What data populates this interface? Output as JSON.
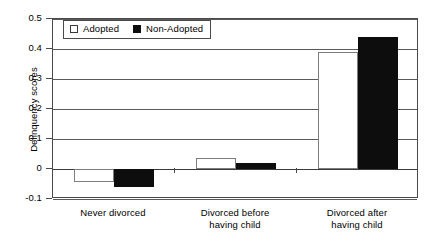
{
  "chart_data": {
    "type": "bar",
    "title": "",
    "xlabel": "",
    "ylabel": "Delinquency scores",
    "ylim": [
      -0.1,
      0.5
    ],
    "ytick_labels": [
      "0.5",
      "0.4",
      "0.3",
      "0.2",
      "0.1",
      "0",
      "-0.1"
    ],
    "ytick_values": [
      0.5,
      0.4,
      0.3,
      0.2,
      0.1,
      0,
      -0.1
    ],
    "grid": true,
    "legend_position": "top-left",
    "categories": [
      "Never divorced",
      "Divorced before having child",
      "Divorced after having child"
    ],
    "category_lines": [
      [
        "Never divorced"
      ],
      [
        "Divorced before",
        "having child"
      ],
      [
        "Divorced after",
        "having child"
      ]
    ],
    "series": [
      {
        "name": "Adopted",
        "color": "#ffffff",
        "edge_color": "#7d7d7d",
        "values": [
          -0.043,
          0.037,
          0.39
        ]
      },
      {
        "name": "Non-Adopted",
        "color": "#0d0d0d",
        "edge_color": "#0d0d0d",
        "values": [
          -0.06,
          0.02,
          0.44
        ]
      }
    ]
  },
  "legend": {
    "entries": [
      {
        "label": "Adopted",
        "swatch": "open-square-icon"
      },
      {
        "label": "Non-Adopted",
        "swatch": "filled-square-icon"
      }
    ]
  },
  "axes": {
    "y_title": "Delinquency scores"
  }
}
